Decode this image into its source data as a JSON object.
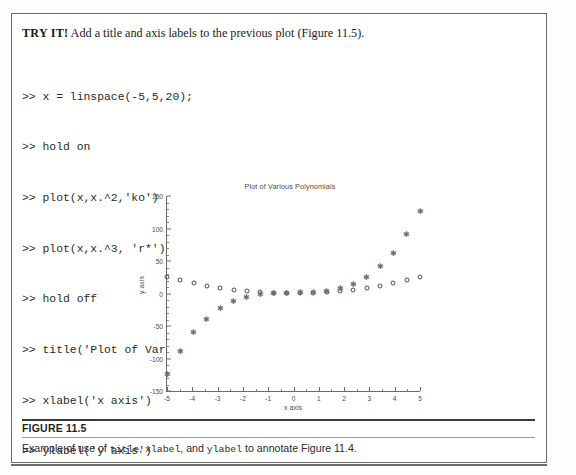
{
  "page": {
    "tryit_label": "TRY IT!",
    "tryit_text": " Add a title and axis labels to the previous plot (Figure 11.5)."
  },
  "code": {
    "lines": [
      ">> x = linspace(-5,5,20);",
      ">> hold on",
      ">> plot(x,x.^2,'ko')",
      ">> plot(x,x.^3, 'r*')",
      ">> hold off",
      ">> title('Plot of Various Polynomials')",
      ">> xlabel('x axis')",
      ">> ylabel('y axis')"
    ]
  },
  "caption": {
    "figure_number": "FIGURE 11.5",
    "text_1": "Example of use of ",
    "code_1": "title",
    "text_2": ", ",
    "code_2": "xlabel",
    "text_3": ", and ",
    "code_3": "ylabel",
    "text_4": " to annotate Figure 11.4."
  },
  "chart_data": {
    "type": "scatter",
    "title": "Plot of Various Polynomials",
    "xlabel": "x axis",
    "ylabel": "y axis",
    "xlim": [
      -5,
      5
    ],
    "ylim": [
      -150,
      150
    ],
    "xticks": [
      -5,
      -4,
      -3,
      -2,
      -1,
      0,
      1,
      2,
      3,
      4,
      5
    ],
    "xtick_labels": [
      "-5",
      "-4",
      "-3",
      "-2",
      "-1",
      "0",
      "1",
      "2",
      "3",
      "4",
      "5"
    ],
    "yticks": [
      -150,
      -100,
      -50,
      0,
      50,
      100,
      150
    ],
    "ytick_labels": [
      "-150",
      "-100",
      "-50",
      "0",
      "50",
      "100",
      "150"
    ],
    "grid": false,
    "legend": null,
    "x": [
      -5,
      -4.4737,
      -3.9474,
      -3.4211,
      -2.8947,
      -2.3684,
      -1.8421,
      -1.3158,
      -0.7895,
      -0.2632,
      0.2632,
      0.7895,
      1.3158,
      1.8421,
      2.3684,
      2.8947,
      3.4211,
      3.9474,
      4.4737,
      5
    ],
    "series": [
      {
        "name": "x.^2",
        "marker": "circle",
        "color": "#4d4d4d",
        "values": [
          25,
          20.01,
          15.58,
          11.7,
          8.38,
          5.61,
          3.39,
          1.73,
          0.62,
          0.07,
          0.07,
          0.62,
          1.73,
          3.39,
          5.61,
          8.38,
          11.7,
          15.58,
          20.01,
          25
        ]
      },
      {
        "name": "x.^3",
        "marker": "star",
        "color": "#6e6e6e",
        "values": [
          -125,
          -89.54,
          -61.5,
          -40.03,
          -24.26,
          -13.29,
          -6.25,
          -2.28,
          -0.49,
          -0.02,
          0.02,
          0.49,
          2.28,
          6.25,
          13.29,
          24.26,
          40.03,
          61.5,
          89.54,
          125
        ]
      }
    ]
  }
}
